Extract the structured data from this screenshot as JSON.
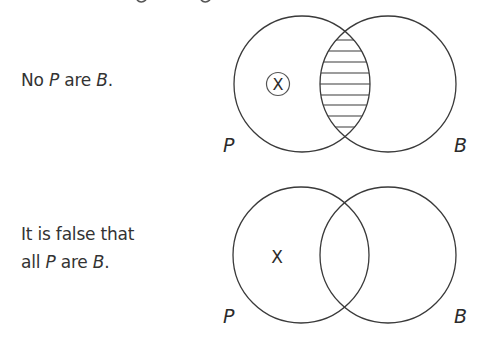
{
  "diagrams": [
    {
      "statement": {
        "prefix": "No ",
        "subject": "P",
        "middle": " are ",
        "predicate": "B",
        "suffix": "."
      },
      "circles": {
        "left_label": "P",
        "right_label": "B",
        "left": {
          "cx": 302,
          "cy": 84,
          "r": 68
        },
        "right": {
          "cx": 388,
          "cy": 84,
          "r": 68
        }
      },
      "marker": {
        "symbol": "X",
        "circled": true,
        "x": 278,
        "y": 84,
        "region": "P only"
      },
      "shaded_region": "P and B intersection",
      "shading_style": "horizontal-hatch"
    },
    {
      "statement": {
        "line1": "It is false that",
        "prefix": "all ",
        "subject": "P",
        "middle": " are ",
        "predicate": "B",
        "suffix": "."
      },
      "circles": {
        "left_label": "P",
        "right_label": "B",
        "left": {
          "cx": 301,
          "cy": 255,
          "r": 68
        },
        "right": {
          "cx": 388,
          "cy": 255,
          "r": 68
        }
      },
      "marker": {
        "symbol": "X",
        "circled": false,
        "x": 277,
        "y": 256,
        "region": "P only"
      },
      "shaded_region": "none"
    }
  ],
  "colors": {
    "line": "#3a3a3a",
    "text": "#333333",
    "background": "#ffffff"
  }
}
